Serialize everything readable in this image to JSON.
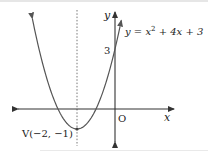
{
  "figure": {
    "type": "parabola-graph",
    "equation": {
      "prefix": "y = x",
      "exponent": "2",
      "suffix": " + 4x + 3",
      "coefficients": {
        "a": 1,
        "b": 4,
        "c": 3
      }
    },
    "axis_labels": {
      "x": "x",
      "y": "y",
      "origin": "O"
    },
    "y_intercept": {
      "value": 3,
      "label": "3"
    },
    "vertex": {
      "x": -2,
      "y": -1,
      "label": "V(−2, −1)"
    },
    "axis_of_symmetry": {
      "x": -2,
      "style": "dotted"
    },
    "x_intercepts": [
      -3,
      -1
    ],
    "x_range": [
      -4.35,
      0.33
    ],
    "colors": {
      "curve": "#555555",
      "axes": "#333333",
      "text": "#222222"
    }
  }
}
